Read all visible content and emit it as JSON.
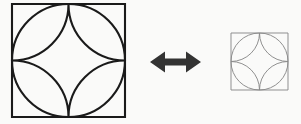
{
  "canvas": {
    "width": 301,
    "height": 124,
    "background_color": "#fafaf9"
  },
  "figure_type": "geometric-diagram",
  "colors": {
    "large_figure_stroke": "#1a1a1a",
    "small_figure_stroke": "#8a8a8a",
    "arrow_fill": "#333333",
    "background": "#fafaf9"
  },
  "elements": {
    "large_figure": {
      "name": "large-geometric-figure",
      "square": {
        "x": 12,
        "y": 4,
        "size": 113
      },
      "inscribed_circle": {
        "cx": 68.5,
        "cy": 60.5,
        "r": 56.5
      },
      "star_arc_radius": 56.5,
      "stroke_width": 2.1,
      "stroke_color": "#1a1a1a",
      "parts": [
        "square-outline",
        "inscribed-circle",
        "four-pointed-star"
      ]
    },
    "arrow": {
      "name": "double-headed-arrow",
      "x1": 150,
      "x2": 201,
      "cy": 62,
      "shaft_height": 7,
      "head_width": 15,
      "head_height": 21,
      "fill": "#333333",
      "direction": "both"
    },
    "small_figure": {
      "name": "small-geometric-figure",
      "square": {
        "x": 231,
        "y": 33,
        "size": 57
      },
      "inscribed_circle": {
        "cx": 259.5,
        "cy": 61.5,
        "r": 28.5
      },
      "star_arc_radius": 28.5,
      "stroke_width": 0.95,
      "stroke_color": "#8a8a8a",
      "parts": [
        "square-outline",
        "inscribed-circle",
        "four-pointed-star"
      ]
    }
  },
  "geometry_paths": {
    "large_square": "M 12 4 H 125 V 117 H 12 Z",
    "large_circle_cx": "68.5",
    "large_circle_cy": "60.5",
    "large_circle_r": "56.5",
    "large_star": "M 68.5 4 A 56.5 56.5 0 0 1 12 60.5 A 56.5 56.5 0 0 1 68.5 117 A 56.5 56.5 0 0 1 125 60.5 A 56.5 56.5 0 0 1 68.5 4 Z",
    "small_square": "M 231 33 H 288 V 90 H 231 Z",
    "small_circle_cx": "259.5",
    "small_circle_cy": "61.5",
    "small_circle_r": "28.5",
    "small_star": "M 259.5 33 A 28.5 28.5 0 0 1 231 61.5 A 28.5 28.5 0 0 1 259.5 90 A 28.5 28.5 0 0 1 288 61.5 A 28.5 28.5 0 0 1 259.5 33 Z",
    "arrow": "M 150 62 L 165 51.5 L 165 58.5 L 186 58.5 L 186 51.5 L 201 62 L 186 72.5 L 186 65.5 L 165 65.5 L 165 72.5 Z"
  }
}
